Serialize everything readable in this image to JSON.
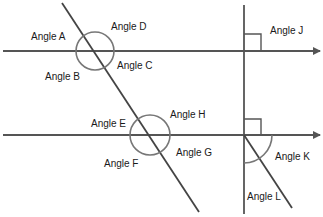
{
  "colors": {
    "line": "#555555",
    "circle": "#777777",
    "text": "#1a1a1a",
    "background": "#ffffff"
  },
  "labels": {
    "angle_a": "Angle A",
    "angle_b": "Angle B",
    "angle_c": "Angle C",
    "angle_d": "Angle D",
    "angle_e": "Angle E",
    "angle_f": "Angle F",
    "angle_g": "Angle G",
    "angle_h": "Angle H",
    "angle_j": "Angle J",
    "angle_k": "Angle K",
    "angle_l": "Angle L"
  }
}
